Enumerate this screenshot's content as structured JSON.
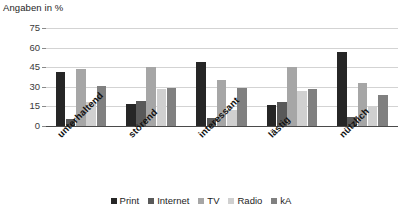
{
  "chart_data": {
    "type": "bar",
    "title": "",
    "ylabel": "Angaben in %",
    "xlabel": "",
    "ylim": [
      0,
      75
    ],
    "yticks": [
      0,
      15,
      30,
      45,
      60,
      75
    ],
    "grid": true,
    "legend_position": "bottom",
    "categories": [
      "unterhaltend",
      "störend",
      "interessant",
      "lästig",
      "nützlich"
    ],
    "series": [
      {
        "name": "Print",
        "color": "#262626",
        "values": [
          41,
          17,
          49,
          16,
          57
        ]
      },
      {
        "name": "Internet",
        "color": "#595959",
        "values": [
          5,
          19,
          6,
          18,
          7
        ]
      },
      {
        "name": "TV",
        "color": "#a6a6a6",
        "values": [
          44,
          45,
          35,
          45,
          33
        ]
      },
      {
        "name": "Radio",
        "color": "#d0d0d0",
        "values": [
          18,
          28,
          12,
          27,
          15
        ]
      },
      {
        "name": "kA",
        "color": "#808080",
        "values": [
          31,
          29,
          29,
          28,
          24
        ]
      }
    ]
  },
  "axis": {
    "y_title": "Angaben in %",
    "tick_labels": [
      "75",
      "60",
      "45",
      "30",
      "15",
      "0"
    ]
  },
  "legend": {
    "items": [
      {
        "label": "Print"
      },
      {
        "label": "Internet"
      },
      {
        "label": "TV"
      },
      {
        "label": "Radio"
      },
      {
        "label": "kA"
      }
    ]
  },
  "colors": {
    "gridline": "#d3d3d3",
    "axis": "#4a4a4a",
    "text": "#1d1d1d",
    "background": "#ffffff"
  }
}
